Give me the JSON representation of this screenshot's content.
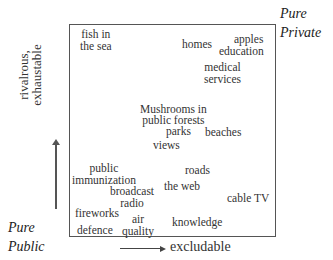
{
  "diagram": {
    "corners": {
      "top_right": [
        "Pure",
        "Private"
      ],
      "bottom_left": [
        "Pure",
        "Public"
      ]
    },
    "axes": {
      "y_label": [
        "rivalrous,",
        "exhaustable"
      ],
      "x_label": "excludable"
    },
    "items": [
      {
        "id": "fish",
        "lines": [
          "fish in",
          "the sea"
        ]
      },
      {
        "id": "homes",
        "lines": [
          "homes"
        ]
      },
      {
        "id": "apples",
        "lines": [
          "apples"
        ]
      },
      {
        "id": "education",
        "lines": [
          "education"
        ]
      },
      {
        "id": "medical",
        "lines": [
          "medical",
          "services"
        ]
      },
      {
        "id": "mushrooms",
        "lines": [
          "Mushrooms in",
          "public forests"
        ]
      },
      {
        "id": "parks",
        "lines": [
          "parks"
        ]
      },
      {
        "id": "beaches",
        "lines": [
          "beaches"
        ]
      },
      {
        "id": "views",
        "lines": [
          "views"
        ]
      },
      {
        "id": "immunization",
        "lines": [
          "public",
          "immunization"
        ]
      },
      {
        "id": "roads",
        "lines": [
          "roads"
        ]
      },
      {
        "id": "broadcast",
        "lines": [
          "broadcast",
          "radio"
        ]
      },
      {
        "id": "web",
        "lines": [
          "the web"
        ]
      },
      {
        "id": "cabletv",
        "lines": [
          "cable TV"
        ]
      },
      {
        "id": "fireworks",
        "lines": [
          "fireworks"
        ]
      },
      {
        "id": "air",
        "lines": [
          "air",
          "quality"
        ]
      },
      {
        "id": "knowledge",
        "lines": [
          "knowledge"
        ]
      },
      {
        "id": "defence",
        "lines": [
          "defence"
        ]
      }
    ]
  }
}
